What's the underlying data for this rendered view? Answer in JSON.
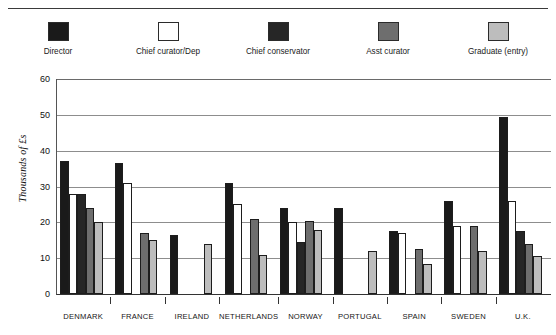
{
  "chart_data": {
    "type": "bar",
    "title": "",
    "xlabel": "",
    "ylabel": "Thousands of £s",
    "ylim": [
      0,
      60
    ],
    "yticks": [
      0,
      10,
      20,
      30,
      40,
      50,
      60
    ],
    "grid": true,
    "legend_position": "top",
    "categories": [
      "DENMARK",
      "FRANCE",
      "IRELAND",
      "NETHERLANDS",
      "NORWAY",
      "PORTUGAL",
      "SPAIN",
      "SWEDEN",
      "U.K."
    ],
    "series": [
      {
        "name": "Director",
        "color": "#1a1a1a",
        "values": [
          37,
          36.5,
          16.5,
          31,
          24,
          24,
          17.5,
          26,
          49.5
        ]
      },
      {
        "name": "Chief curator/Dep",
        "color": "#ffffff",
        "values": [
          28,
          31,
          null,
          25,
          20,
          null,
          17,
          19,
          26
        ]
      },
      {
        "name": "Chief conservator",
        "color": "#262626",
        "values": [
          28,
          null,
          null,
          null,
          14.5,
          null,
          null,
          null,
          17.5
        ]
      },
      {
        "name": "Asst curator",
        "color": "#6e6e6e",
        "values": [
          24,
          17,
          null,
          21,
          20.5,
          null,
          12.5,
          19,
          14
        ]
      },
      {
        "name": "Graduate (entry)",
        "color": "#bdbdbd",
        "values": [
          20,
          15,
          14,
          11,
          18,
          12,
          8.5,
          12,
          10.5
        ]
      }
    ]
  },
  "legend": {
    "items": [
      {
        "label": "Director",
        "color": "#1a1a1a"
      },
      {
        "label": "Chief curator/Dep",
        "color": "#ffffff"
      },
      {
        "label": "Chief conservator",
        "color": "#262626"
      },
      {
        "label": "Asst curator",
        "color": "#6e6e6e"
      },
      {
        "label": "Graduate (entry)",
        "color": "#bdbdbd"
      }
    ]
  },
  "axis": {
    "y_label": "Thousands of £s",
    "y_ticks": [
      "60",
      "50",
      "40",
      "30",
      "20",
      "10",
      "0"
    ],
    "x_labels": [
      "DENMARK",
      "FRANCE",
      "IRELAND",
      "NETHERLANDS",
      "NORWAY",
      "PORTUGAL",
      "SPAIN",
      "SWEDEN",
      "U.K."
    ]
  }
}
